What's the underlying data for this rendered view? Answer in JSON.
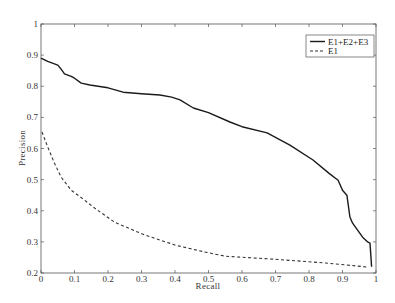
{
  "chart_data": {
    "type": "line",
    "title": "",
    "xlabel": "Recall",
    "ylabel": "Precision",
    "xlim": [
      0,
      1
    ],
    "ylim": [
      0.2,
      1
    ],
    "xticks": [
      0,
      0.1,
      0.2,
      0.3,
      0.4,
      0.5,
      0.6,
      0.7,
      0.8,
      0.9,
      1
    ],
    "xtick_labels": [
      "0",
      "0.1",
      "0.2",
      "0.3",
      "0.4",
      "0.5",
      "0.6",
      "0.7",
      "0.8",
      "0.9",
      "1"
    ],
    "yticks": [
      0.2,
      0.3,
      0.4,
      0.5,
      0.6,
      0.7,
      0.8,
      0.9,
      1
    ],
    "ytick_labels": [
      "0.2",
      "0.3",
      "0.4",
      "0.5",
      "0.6",
      "0.7",
      "0.8",
      "0.9",
      "1"
    ],
    "grid": false,
    "legend_position": "upper right",
    "series": [
      {
        "name": "E1+E2+E3",
        "style": "solid",
        "color": "#1a1a1a",
        "x": [
          0.0,
          0.02,
          0.05,
          0.06,
          0.07,
          0.09,
          0.1,
          0.12,
          0.146,
          0.2,
          0.245,
          0.3,
          0.355,
          0.39,
          0.415,
          0.455,
          0.5,
          0.564,
          0.6,
          0.675,
          0.743,
          0.812,
          0.86,
          0.887,
          0.9,
          0.913,
          0.922,
          0.93,
          0.96,
          0.976,
          0.982,
          0.987
        ],
        "y": [
          0.89,
          0.88,
          0.868,
          0.855,
          0.84,
          0.832,
          0.826,
          0.81,
          0.804,
          0.795,
          0.781,
          0.776,
          0.772,
          0.765,
          0.756,
          0.73,
          0.715,
          0.685,
          0.67,
          0.65,
          0.611,
          0.563,
          0.52,
          0.498,
          0.466,
          0.45,
          0.38,
          0.36,
          0.315,
          0.299,
          0.296,
          0.22
        ]
      },
      {
        "name": "E1",
        "style": "dashed",
        "color": "#333333",
        "x": [
          0.003,
          0.02,
          0.04,
          0.06,
          0.09,
          0.13,
          0.161,
          0.22,
          0.31,
          0.4,
          0.49,
          0.55,
          0.7,
          0.85,
          0.976
        ],
        "y": [
          0.653,
          0.605,
          0.553,
          0.508,
          0.466,
          0.434,
          0.408,
          0.363,
          0.322,
          0.29,
          0.267,
          0.254,
          0.244,
          0.232,
          0.219
        ]
      }
    ]
  },
  "legend": {
    "items": [
      {
        "label": "E1+E2+E3",
        "style": "solid"
      },
      {
        "label": "E1",
        "style": "dashed"
      }
    ]
  },
  "axes": {
    "xlabel": "Recall",
    "ylabel": "Precision"
  },
  "colors": {
    "axis": "#555555",
    "background": "#ffffff"
  }
}
